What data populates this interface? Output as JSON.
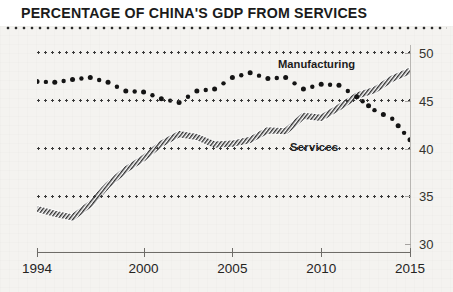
{
  "header": {
    "title": "PERCENTAGE OF CHINA'S GDP FROM SERVICES"
  },
  "chart_data": {
    "type": "line",
    "title": "PERCENTAGE OF CHINA'S GDP FROM SERVICES",
    "xlabel": "",
    "ylabel": "",
    "xlim": [
      1994,
      2015
    ],
    "ylim": [
      29.2,
      50.8
    ],
    "grid": true,
    "gridlines": [
      50,
      45,
      40,
      35
    ],
    "yticks": [
      30,
      35,
      40,
      45,
      50
    ],
    "ytick_labels": [
      "30",
      "35",
      "40",
      "45",
      "50"
    ],
    "xticks": [
      1994,
      2000,
      2005,
      2010,
      2015
    ],
    "xtick_labels": [
      "1994",
      "2000",
      "2005",
      "2010",
      "2015"
    ],
    "legend_position": "inline-annotation",
    "series": [
      {
        "name": "Manufacturing",
        "style": "dotted-markers",
        "color": "#141414",
        "x": [
          1994,
          1995,
          1996,
          1997,
          1998,
          1999,
          2000,
          2001,
          2002,
          2003,
          2004,
          2005,
          2006,
          2007,
          2008,
          2009,
          2010,
          2011,
          2012,
          2013,
          2014,
          2015
        ],
        "values": [
          47.0,
          46.9,
          47.2,
          47.4,
          46.9,
          46.0,
          45.9,
          45.2,
          44.8,
          46.0,
          46.2,
          47.4,
          47.9,
          47.3,
          47.4,
          46.2,
          46.7,
          46.6,
          45.4,
          44.0,
          43.1,
          40.9
        ]
      },
      {
        "name": "Services",
        "style": "hatched-line",
        "color": "#5a5a5a",
        "x": [
          1994,
          1995,
          1996,
          1997,
          1998,
          1999,
          2000,
          2001,
          2002,
          2003,
          2004,
          2005,
          2006,
          2007,
          2008,
          2009,
          2010,
          2011,
          2012,
          2013,
          2014,
          2015
        ],
        "values": [
          33.7,
          33.2,
          32.8,
          34.2,
          36.2,
          37.8,
          39.0,
          40.5,
          41.5,
          41.2,
          40.4,
          40.5,
          40.9,
          41.9,
          41.8,
          43.4,
          43.2,
          44.3,
          45.5,
          46.1,
          47.3,
          48.1
        ]
      }
    ],
    "annotations": [
      {
        "text": "Manufacturing",
        "x": 2008,
        "y": 49.0
      },
      {
        "text": "Services",
        "x": 2008.5,
        "y": 39.7
      }
    ]
  }
}
